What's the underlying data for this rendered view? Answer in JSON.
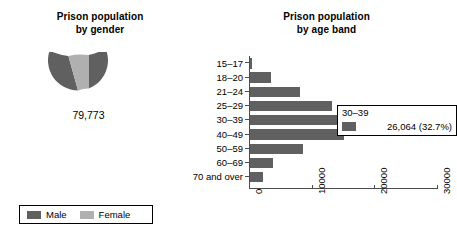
{
  "colors": {
    "male": "#606060",
    "female": "#b0b0b0",
    "axis": "#4d4d4d",
    "background": "#ffffff",
    "text": "#000000"
  },
  "gender_chart": {
    "title_line1": "Prison population",
    "title_line2": "by gender",
    "center_value": "79,773",
    "legend": [
      {
        "label": "Male",
        "color": "#606060"
      },
      {
        "label": "Female",
        "color": "#b0b0b0"
      }
    ]
  },
  "age_chart": {
    "title_line1": "Prison population",
    "title_line2": "by age band"
  },
  "tooltip": {
    "title": "30–39",
    "value": "26,064 (32.7%)",
    "swatch_color": "#606060"
  },
  "chart_data": [
    {
      "type": "pie",
      "title": "Prison population by gender",
      "subtitle": "",
      "variant": "donut",
      "center_label": "79,773",
      "total": 79773,
      "labels": [
        "Male",
        "Female"
      ],
      "values": [
        76110,
        3663
      ],
      "percentages": [
        95.41,
        4.59
      ],
      "colors": [
        "#606060",
        "#b0b0b0"
      ],
      "legend_position": "bottom",
      "start_angle_deg": -18,
      "grid": false
    },
    {
      "type": "bar",
      "orientation": "horizontal",
      "title": "Prison population by age band",
      "xlabel": "",
      "ylabel": "",
      "categories": [
        "15–17",
        "18–20",
        "21–24",
        "25–29",
        "30–39",
        "40–49",
        "50–59",
        "60–69",
        "70 and over"
      ],
      "values": [
        200,
        3300,
        8000,
        13100,
        26064,
        15100,
        8500,
        3700,
        2100
      ],
      "highlight_category": "30–39",
      "highlight_value": 26064,
      "highlight_percent": "32.7%",
      "xlim": [
        0,
        30000
      ],
      "xticks": [
        0,
        10000,
        20000,
        30000
      ],
      "xticklabels": [
        "0",
        "10000",
        "20000",
        "30000"
      ],
      "xticklabel_rotation": -90,
      "bar_color": "#606060",
      "grid": false,
      "legend_position": "none"
    }
  ]
}
